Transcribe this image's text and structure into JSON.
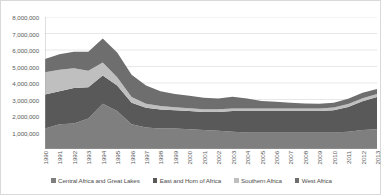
{
  "chart_data": {
    "type": "area",
    "stacked": true,
    "title": "",
    "xlabel": "",
    "ylabel": "",
    "ylim": [
      0,
      8000000
    ],
    "y_ticks": [
      "1,000,000",
      "2,000,000",
      "3,000,000",
      "4,000,000",
      "5,000,000",
      "6,000,000",
      "7,000,000",
      "8,000,000"
    ],
    "y_tick_values": [
      1000000,
      2000000,
      3000000,
      4000000,
      5000000,
      6000000,
      7000000,
      8000000
    ],
    "grid": true,
    "legend_position": "bottom",
    "categories": [
      "1990",
      "1991",
      "1992",
      "1993",
      "1994",
      "1995",
      "1996",
      "1997",
      "1998",
      "1999",
      "2000",
      "2001",
      "2002",
      "2003",
      "2004",
      "2005",
      "2006",
      "2007",
      "2008",
      "2009",
      "2010",
      "2011",
      "2012",
      "2013"
    ],
    "series": [
      {
        "name": "Central Africa and Great Lakes",
        "color": "#7f7f7f",
        "values": [
          1250000,
          1500000,
          1550000,
          1850000,
          2750000,
          2300000,
          1500000,
          1300000,
          1250000,
          1250000,
          1200000,
          1150000,
          1100000,
          1050000,
          1000000,
          1000000,
          1000000,
          1000000,
          1000000,
          1000000,
          1000000,
          1050000,
          1150000,
          1200000
        ]
      },
      {
        "name": "East and Horn of Africa",
        "color": "#595959",
        "values": [
          2050000,
          2000000,
          2150000,
          1900000,
          1700000,
          1550000,
          1300000,
          1200000,
          1150000,
          1100000,
          1100000,
          1100000,
          1150000,
          1250000,
          1300000,
          1300000,
          1300000,
          1300000,
          1300000,
          1300000,
          1350000,
          1500000,
          1750000,
          1950000
        ]
      },
      {
        "name": "Southern Africa",
        "color": "#bfbfbf",
        "values": [
          1350000,
          1300000,
          1200000,
          1000000,
          800000,
          500000,
          350000,
          250000,
          200000,
          180000,
          170000,
          160000,
          160000,
          160000,
          160000,
          160000,
          160000,
          160000,
          160000,
          160000,
          160000,
          170000,
          180000,
          180000
        ]
      },
      {
        "name": "West Africa",
        "color": "#6e6e6e",
        "values": [
          800000,
          950000,
          1000000,
          1150000,
          1450000,
          1500000,
          1350000,
          1100000,
          900000,
          800000,
          750000,
          700000,
          650000,
          700000,
          600000,
          450000,
          400000,
          350000,
          300000,
          280000,
          300000,
          320000,
          330000,
          300000
        ]
      }
    ]
  }
}
